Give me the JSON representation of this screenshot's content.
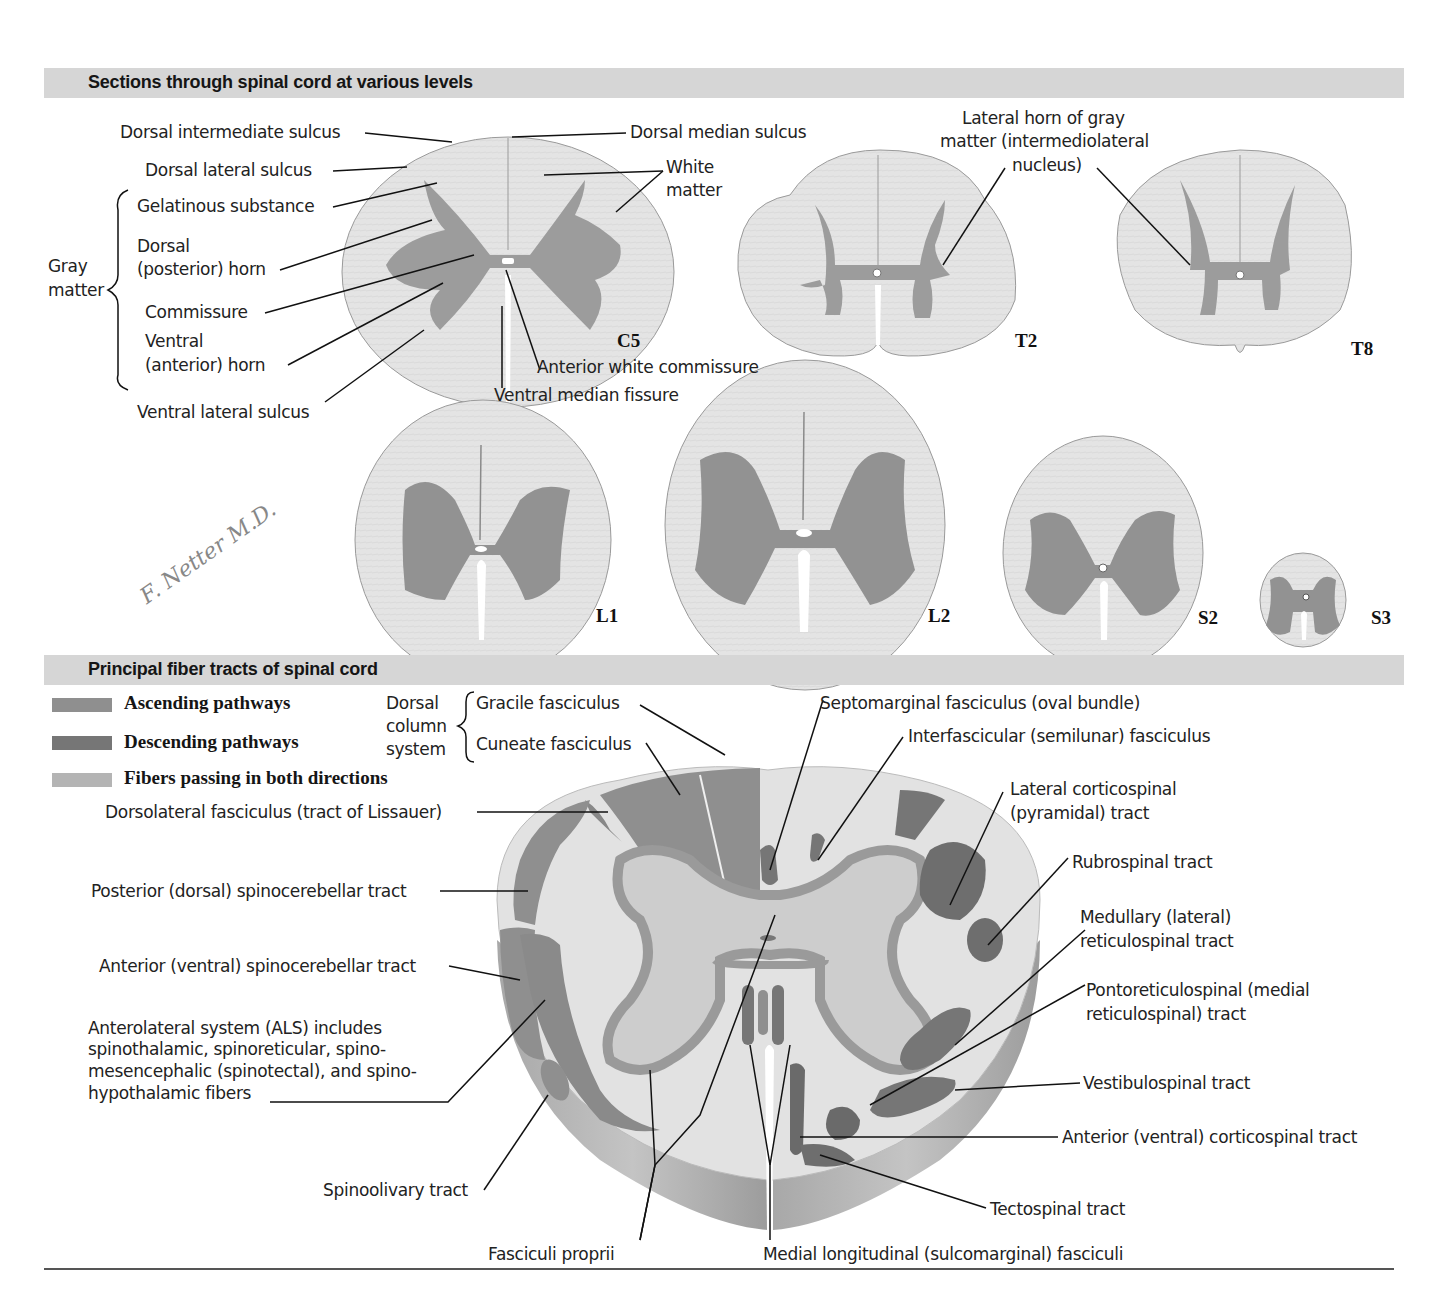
{
  "section1": {
    "title": "Sections through spinal cord at various levels",
    "labels": {
      "dorsal_intermediate_sulcus": "Dorsal intermediate sulcus",
      "dorsal_median_sulcus": "Dorsal median sulcus",
      "dorsal_lateral_sulcus": "Dorsal lateral sulcus",
      "white_matter_1": "White",
      "white_matter_2": "matter",
      "gray_matter_1": "Gray",
      "gray_matter_2": "matter",
      "gelatinous_substance": "Gelatinous substance",
      "dorsal_horn_1": "Dorsal",
      "dorsal_horn_2": "(posterior) horn",
      "commissure": "Commissure",
      "ventral_horn_1": "Ventral",
      "ventral_horn_2": "(anterior) horn",
      "ventral_lateral_sulcus": "Ventral lateral sulcus",
      "anterior_white_commissure": "Anterior white commissure",
      "ventral_median_fissure": "Ventral median fissure",
      "lateral_horn_1": "Lateral horn of gray",
      "lateral_horn_2": "matter (intermediolateral",
      "lateral_horn_3": "nucleus)"
    },
    "levels": [
      "C5",
      "T2",
      "T8",
      "L1",
      "L2",
      "S2",
      "S3"
    ],
    "signature": "F. Netter M.D."
  },
  "section2": {
    "title": "Principal fiber tracts of spinal cord",
    "legend": [
      {
        "label": "Ascending pathways",
        "color": "#8f8f8f"
      },
      {
        "label": "Descending pathways",
        "color": "#767676"
      },
      {
        "label": "Fibers passing in both directions",
        "color": "#b4b4b4"
      }
    ],
    "dorsal_column": {
      "group_1": "Dorsal",
      "group_2": "column",
      "group_3": "system",
      "gracile": "Gracile fasciculus",
      "cuneate": "Cuneate fasciculus"
    },
    "labels": {
      "lissauer": "Dorsolateral fasciculus (tract of Lissauer)",
      "posterior_spinocerebellar": "Posterior (dorsal) spinocerebellar tract",
      "anterior_spinocerebellar": "Anterior (ventral) spinocerebellar tract",
      "als_1": "Anterolateral system (ALS) includes",
      "als_2": "spinothalamic, spinoreticular, spino-",
      "als_3": "mesencephalic (spinotectal), and spino-",
      "als_4": "hypothalamic fibers",
      "spinoolivary": "Spinoolivary tract",
      "fasciculi_proprii": "Fasciculi proprii",
      "medial_longitudinal": "Medial longitudinal (sulcomarginal) fasciculi",
      "septomarginal": "Septomarginal fasciculus (oval bundle)",
      "interfascicular": "Interfascicular (semilunar) fasciculus",
      "lateral_corticospinal_1": "Lateral corticospinal",
      "lateral_corticospinal_2": "(pyramidal) tract",
      "rubrospinal": "Rubrospinal tract",
      "medullary_1": "Medullary (lateral)",
      "medullary_2": "reticulospinal tract",
      "pontoreticulospinal_1": "Pontoreticulospinal (medial",
      "pontoreticulospinal_2": "reticulospinal) tract",
      "vestibulospinal": "Vestibulospinal tract",
      "anterior_corticospinal": "Anterior (ventral) corticospinal tract",
      "tectospinal": "Tectospinal tract"
    }
  },
  "colors": {
    "band": "#d6d6d6",
    "white_matter": "#e6e6e6",
    "gray_matter": "#9a9a9a",
    "ascending": "#8f8f8f",
    "descending": "#767676",
    "both": "#b4b4b4"
  }
}
